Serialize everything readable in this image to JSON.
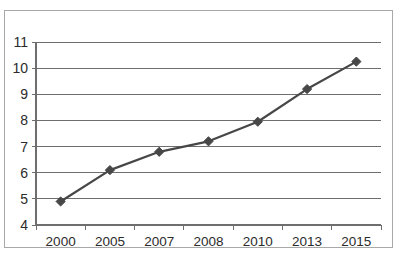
{
  "chart_data": {
    "type": "line",
    "title": "",
    "subtitle": "",
    "xlabel": "",
    "ylabel": "",
    "categories": [
      "2000",
      "2005",
      "2007",
      "2008",
      "2010",
      "2013",
      "2015"
    ],
    "x": [
      2000,
      2005,
      2007,
      2008,
      2010,
      2013,
      2015
    ],
    "values": [
      4.9,
      6.1,
      6.8,
      7.2,
      7.95,
      9.2,
      10.25
    ],
    "series": [
      {
        "name": "series-1",
        "values": [
          4.9,
          6.1,
          6.8,
          7.2,
          7.95,
          9.2,
          10.25
        ]
      }
    ],
    "ylim": [
      4,
      11
    ],
    "yticks": [
      4,
      5,
      6,
      7,
      8,
      9,
      10,
      11
    ],
    "ytick_labels": [
      "4",
      "5",
      "6",
      "7",
      "8",
      "9",
      "10",
      "11"
    ],
    "xtick_labels": [
      "2000",
      "2005",
      "2007",
      "2008",
      "2010",
      "2013",
      "2015"
    ],
    "grid": true,
    "grid_axis": "y",
    "legend": false,
    "legend_position": "none",
    "marker": "diamond",
    "line_color": "#474747",
    "marker_color": "#474747",
    "grid_color": "#6e6e6e",
    "axis_color": "#6e6e6e",
    "border_color": "#a8a8a8",
    "background_color": "#ffffff"
  }
}
